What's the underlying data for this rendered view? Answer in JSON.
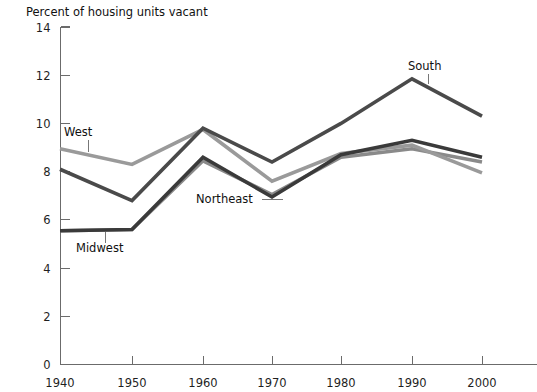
{
  "chart_data": {
    "type": "line",
    "title": "",
    "ylabel": "Percent of housing units vacant",
    "xlabel": "",
    "categories": [
      1940,
      1950,
      1960,
      1970,
      1980,
      1990,
      2000
    ],
    "x_tick_labels": [
      "1940",
      "1950",
      "1960",
      "1970",
      "1980",
      "1990",
      "2000"
    ],
    "y_tick_labels": [
      "0",
      "2",
      "4",
      "6",
      "8",
      "10",
      "12",
      "14"
    ],
    "y_ticks": [
      0,
      2,
      4,
      6,
      8,
      10,
      12,
      14
    ],
    "ylim": [
      0,
      14
    ],
    "grid": false,
    "legend_position": "inline-annotations",
    "series": [
      {
        "name": "South",
        "color": "#4a4a4a",
        "values": [
          8.1,
          6.8,
          9.8,
          8.4,
          10.0,
          11.85,
          10.3
        ]
      },
      {
        "name": "West",
        "color": "#9a9a9a",
        "values": [
          8.95,
          8.3,
          9.75,
          7.6,
          8.75,
          9.1,
          7.95
        ]
      },
      {
        "name": "Northeast",
        "color": "#3a3a3a",
        "values": [
          5.55,
          5.6,
          8.6,
          6.95,
          8.7,
          9.3,
          8.6
        ]
      },
      {
        "name": "Midwest",
        "color": "#8a8a8a",
        "values": [
          5.55,
          5.6,
          8.45,
          7.05,
          8.6,
          8.95,
          8.4
        ]
      }
    ],
    "annotations": [
      {
        "label": "West",
        "x": 1940,
        "y": 8.95
      },
      {
        "label": "Midwest",
        "x": 1940,
        "y": 5.55
      },
      {
        "label": "Northeast",
        "x": 1970,
        "y": 6.95
      },
      {
        "label": "South",
        "x": 1990,
        "y": 11.85
      }
    ]
  },
  "colors": {
    "axis": "#6b6b6b",
    "text": "#111111",
    "background": "#ffffff"
  }
}
